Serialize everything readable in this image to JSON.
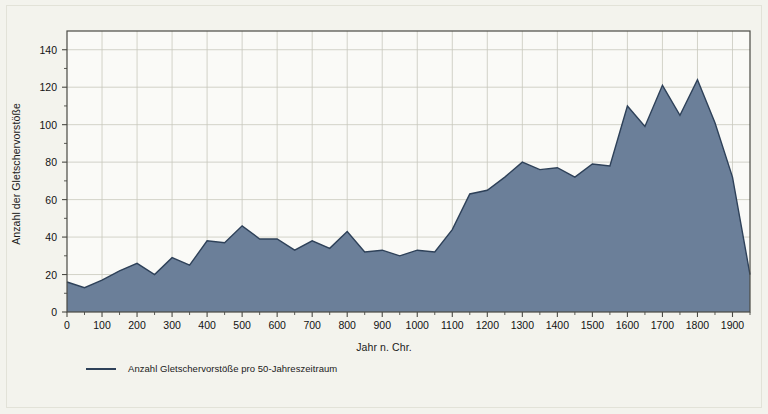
{
  "chart_data": {
    "type": "area",
    "title": "",
    "xlabel": "Jahr n. Chr.",
    "ylabel": "Anzahl der Gletschervorstöße",
    "legend": [
      {
        "label": "Anzahl Gletschervorstöße pro 50-Jahreszeitraum",
        "color": "#6b7f99"
      }
    ],
    "legend_position": "bottom-left",
    "grid": true,
    "xlim": [
      0,
      1950
    ],
    "ylim": [
      0,
      150
    ],
    "x_major_step": 100,
    "x_minor_step": 50,
    "y_major_step": 20,
    "y_minor_step": 10,
    "x_tick_labels": [
      "0",
      "100",
      "200",
      "300",
      "400",
      "500",
      "600",
      "700",
      "800",
      "900",
      "1000",
      "1100",
      "1200",
      "1300",
      "1400",
      "1500",
      "1600",
      "1700",
      "1800",
      "1900"
    ],
    "y_tick_labels": [
      "0",
      "20",
      "40",
      "60",
      "80",
      "100",
      "120",
      "140"
    ],
    "series": [
      {
        "name": "Anzahl Gletschervorstöße pro 50-Jahreszeitraum",
        "color": "#6b7f99",
        "line_color": "#2e4159",
        "x": [
          0,
          50,
          100,
          150,
          200,
          250,
          300,
          350,
          400,
          450,
          500,
          550,
          600,
          650,
          700,
          750,
          800,
          850,
          900,
          950,
          1000,
          1050,
          1100,
          1150,
          1200,
          1250,
          1300,
          1350,
          1400,
          1450,
          1500,
          1550,
          1600,
          1650,
          1700,
          1750,
          1800,
          1850,
          1900,
          1950
        ],
        "values": [
          16,
          13,
          17,
          22,
          26,
          20,
          29,
          25,
          38,
          37,
          46,
          39,
          39,
          33,
          38,
          34,
          43,
          32,
          33,
          30,
          33,
          32,
          44,
          63,
          65,
          72,
          80,
          76,
          77,
          72,
          79,
          78,
          110,
          99,
          121,
          105,
          124,
          101,
          72,
          20
        ]
      }
    ]
  },
  "colors": {
    "background": "#f3f3ed",
    "plot_background": "#fafaf7",
    "grid": "#c8c8bd",
    "axis": "#4a4a44",
    "area_fill": "#6b7f99",
    "area_line": "#2e4159",
    "text": "#1a1a1a"
  }
}
